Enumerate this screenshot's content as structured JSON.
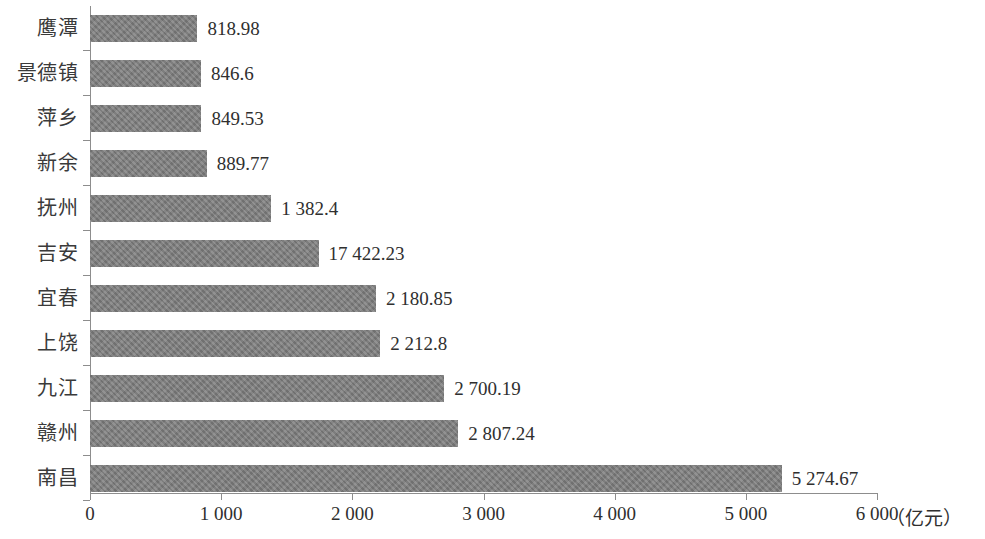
{
  "chart_data": {
    "type": "bar",
    "orientation": "horizontal",
    "title": "",
    "subtitle": "",
    "xlabel": "（亿元）",
    "ylabel": "",
    "xlim": [
      0,
      6000
    ],
    "grid": false,
    "legend": false,
    "bar_color": "#7d7d7d",
    "axis_color": "#8d8d8d",
    "x_ticks": [
      {
        "value": 0,
        "label": "0"
      },
      {
        "value": 1000,
        "label": "1 000"
      },
      {
        "value": 2000,
        "label": "2 000"
      },
      {
        "value": 3000,
        "label": "3 000"
      },
      {
        "value": 4000,
        "label": "4 000"
      },
      {
        "value": 5000,
        "label": "5 000"
      },
      {
        "value": 6000,
        "label": "6 000"
      }
    ],
    "unit_annotation": "（亿元）",
    "categories": [
      "鹰潭",
      "景德镇",
      "萍乡",
      "新余",
      "抚州",
      "吉安",
      "宜春",
      "上饶",
      "九江",
      "赣州",
      "南昌"
    ],
    "values": [
      818.98,
      846.6,
      849.53,
      889.77,
      1382.4,
      1742.23,
      2180.85,
      2212.8,
      2700.19,
      2807.24,
      5274.67
    ],
    "data_labels": [
      "818.98",
      "846.6",
      "849.53",
      "889.77",
      "1 382.4",
      "17 422.23",
      "2 180.85",
      "2 212.8",
      "2 700.19",
      "2 807.24",
      "5 274.67"
    ],
    "bars": [
      {
        "category": "鹰潭",
        "value": 818.98,
        "label": "818.98"
      },
      {
        "category": "景德镇",
        "value": 846.6,
        "label": "846.6"
      },
      {
        "category": "萍乡",
        "value": 849.53,
        "label": "849.53"
      },
      {
        "category": "新余",
        "value": 889.77,
        "label": "889.77"
      },
      {
        "category": "抚州",
        "value": 1382.4,
        "label": "1 382.4"
      },
      {
        "category": "吉安",
        "value": 1742.23,
        "label": "17 422.23"
      },
      {
        "category": "宜春",
        "value": 2180.85,
        "label": "2 180.85"
      },
      {
        "category": "上饶",
        "value": 2212.8,
        "label": "2 212.8"
      },
      {
        "category": "九江",
        "value": 2700.19,
        "label": "2 700.19"
      },
      {
        "category": "赣州",
        "value": 2807.24,
        "label": "2 807.24"
      },
      {
        "category": "南昌",
        "value": 5274.67,
        "label": "5 274.67"
      }
    ]
  }
}
